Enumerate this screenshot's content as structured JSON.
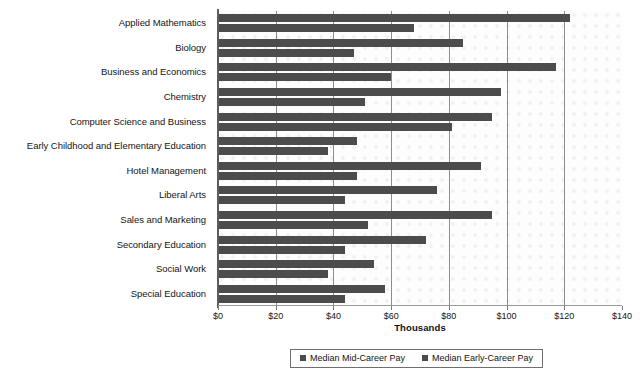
{
  "chart_data": {
    "type": "bar",
    "orientation": "horizontal",
    "title": "",
    "xlabel": "Thousands",
    "ylabel": "",
    "xlim": [
      0,
      140
    ],
    "xticks": [
      0,
      20,
      40,
      60,
      80,
      100,
      120,
      140
    ],
    "xtick_labels": [
      "$0",
      "$20",
      "$40",
      "$60",
      "$80",
      "$100",
      "$120",
      "$140"
    ],
    "grid": true,
    "legend_position": "bottom",
    "categories": [
      "Applied Mathematics",
      "Biology",
      "Business and Economics",
      "Chemistry",
      "Computer Science and Business",
      "Early Childhood and Elementary Education",
      "Hotel Management",
      "Liberal Arts",
      "Sales and Marketing",
      "Secondary Education",
      "Social Work",
      "Special Education"
    ],
    "series": [
      {
        "name": "Median Mid-Career Pay",
        "color": "#4c4c4c",
        "values": [
          122,
          85,
          117,
          98,
          95,
          48,
          91,
          76,
          95,
          72,
          54,
          58
        ]
      },
      {
        "name": "Median Early-Career Pay",
        "color": "#4c4c4c",
        "values": [
          68,
          47,
          60,
          51,
          81,
          38,
          48,
          44,
          52,
          44,
          38,
          44
        ]
      }
    ]
  },
  "legend": {
    "items": [
      {
        "label": "Median Mid-Career Pay"
      },
      {
        "label": "Median Early-Career Pay"
      }
    ]
  }
}
